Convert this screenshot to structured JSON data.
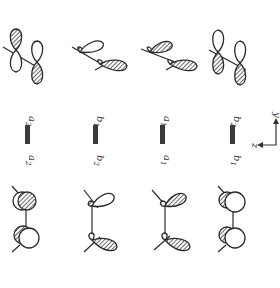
{
  "figure": {
    "columns": [
      {
        "id": "col1",
        "top_label": "a",
        "top_sub": "2",
        "bottom_label": "a",
        "bottom_sub": "2"
      },
      {
        "id": "col2",
        "top_label": "b",
        "top_sub": "1",
        "bottom_label": "b",
        "bottom_sub": "2"
      },
      {
        "id": "col3",
        "top_label": "a",
        "top_sub": "1",
        "bottom_label": "a",
        "bottom_sub": "1"
      },
      {
        "id": "col4",
        "top_label": "b",
        "top_sub": "2",
        "bottom_label": "b",
        "bottom_sub": "1"
      }
    ],
    "axes": {
      "vertical": "y",
      "horizontal": "z"
    },
    "colors": {
      "ink": "#2a2a2a",
      "hatch": "#555555",
      "background": "#ffffff"
    }
  }
}
